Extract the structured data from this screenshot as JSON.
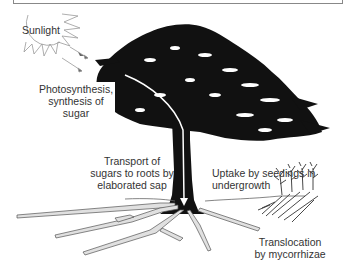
{
  "diagram": {
    "type": "tree-carbon-flow",
    "labels": {
      "sunlight": "Sunlight",
      "photosynthesis": [
        "Photosynthesis,",
        "synthesis of",
        "sugar"
      ],
      "transport": [
        "Transport of",
        "sugars to roots by",
        "elaborated sap"
      ],
      "uptake": [
        "Uptake by seedings in",
        "undergrowth"
      ],
      "translocation": [
        "Translocation",
        "by mycorrhizae"
      ]
    },
    "colors": {
      "tree": "#111111",
      "roots_fill": "#dcdcdc",
      "roots_stroke": "#666666",
      "arrow": "#ffffff",
      "text": "#333333"
    }
  }
}
